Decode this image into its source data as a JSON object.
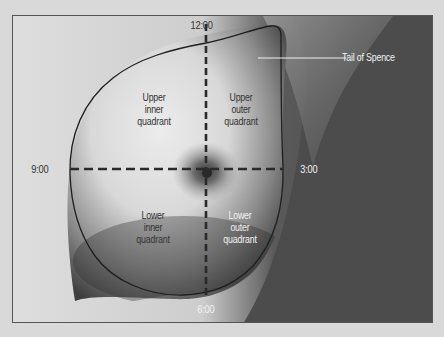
{
  "figure": {
    "clock_positions": {
      "top": "12:00",
      "right": "3:00",
      "bottom": "6:00",
      "left": "9:00"
    },
    "quadrants": {
      "upper_inner": [
        "Upper",
        "inner",
        "quadrant"
      ],
      "upper_outer": [
        "Upper",
        "outer",
        "quadrant"
      ],
      "lower_inner": [
        "Lower",
        "inner",
        "quadrant"
      ],
      "lower_outer": [
        "Lower",
        "outer",
        "quadrant"
      ]
    },
    "callout": {
      "label": "Tail of Spence"
    },
    "colors": {
      "outline": "#1e1e1e",
      "dashed_axes": "#2a2a2a",
      "callout_line": "#f0f0f0",
      "background_dark": "#4a4a4a",
      "skin_light": "#e6e6e6"
    }
  }
}
